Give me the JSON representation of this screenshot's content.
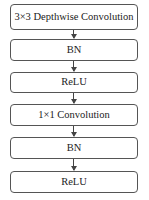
{
  "diagram": {
    "type": "flowchart",
    "direction": "top-to-bottom",
    "nodes": [
      {
        "id": "n1",
        "label": "3×3 Depthwise Convolution"
      },
      {
        "id": "n2",
        "label": "BN"
      },
      {
        "id": "n3",
        "label": "ReLU"
      },
      {
        "id": "n4",
        "label": "1×1 Convolution"
      },
      {
        "id": "n5",
        "label": "BN"
      },
      {
        "id": "n6",
        "label": "ReLU"
      }
    ],
    "edges": [
      {
        "from": "n1",
        "to": "n2"
      },
      {
        "from": "n2",
        "to": "n3"
      },
      {
        "from": "n3",
        "to": "n4"
      },
      {
        "from": "n4",
        "to": "n5"
      },
      {
        "from": "n5",
        "to": "n6"
      }
    ],
    "colors": {
      "border": "#555555",
      "arrow": "#444444",
      "background": "#ffffff",
      "text": "#222222"
    }
  }
}
